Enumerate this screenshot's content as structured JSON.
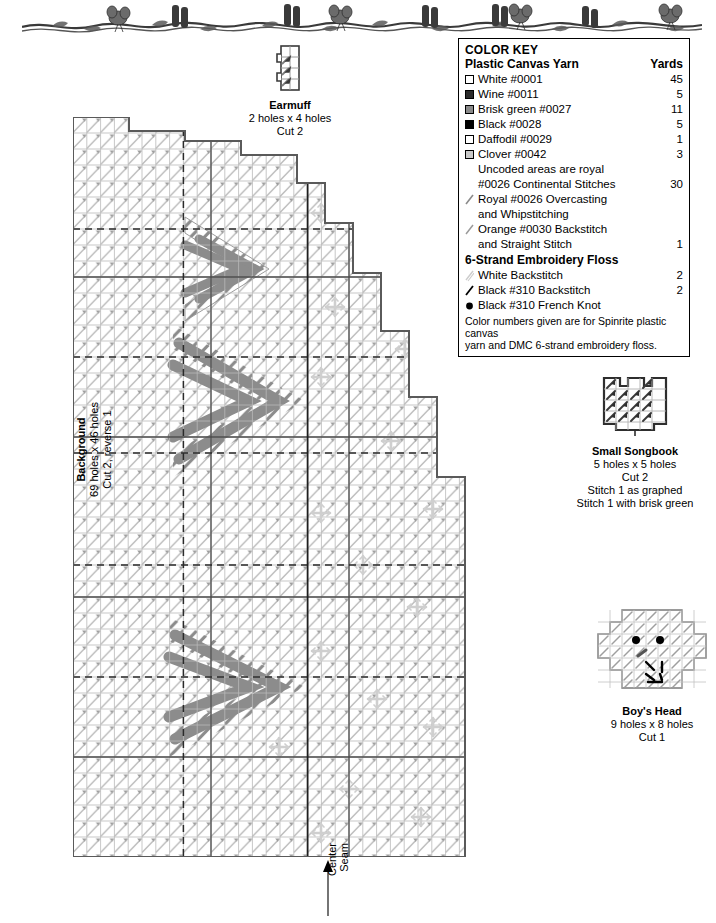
{
  "banner": {
    "icon": "vine-floral-border"
  },
  "color_key": {
    "title": "COLOR KEY",
    "section1_label": "Plastic Canvas Yarn",
    "yards_header": "Yards",
    "yarn_rows": [
      {
        "swatch": "white-swatch",
        "color": "#ffffff",
        "label": "White #0001",
        "yards": "45"
      },
      {
        "swatch": "wine-swatch",
        "color": "#2b2b2b",
        "label": "Wine #0011",
        "yards": "5"
      },
      {
        "swatch": "brisk-green-swatch",
        "color": "#8a8a8a",
        "label": "Brisk green #0027",
        "yards": "11"
      },
      {
        "swatch": "black-swatch",
        "color": "#000000",
        "label": "Black #0028",
        "yards": "5"
      },
      {
        "swatch": "daffodil-swatch",
        "color": "#ffffff",
        "label": "Daffodil #0029",
        "yards": "1"
      },
      {
        "swatch": "clover-swatch",
        "color": "#c8c8c8",
        "label": "Clover #0042",
        "yards": "3"
      }
    ],
    "uncoded_line1": "Uncoded areas are royal",
    "uncoded_line2": "#0026 Continental Stitches",
    "uncoded_yards": "30",
    "stitch_rows": [
      {
        "icon": "royal-overcasting-stroke-icon",
        "color": "#8a8a8a",
        "line1": "Royal #0026 Overcasting",
        "line2": "and Whipstitching",
        "yards": ""
      },
      {
        "icon": "orange-backstitch-stroke-icon",
        "color": "#9a9a9a",
        "line1": "Orange #0030 Backstitch",
        "line2": "and Straight Stitch",
        "yards": "1"
      }
    ],
    "section2_label": "6-Strand Embroidery Floss",
    "floss_rows": [
      {
        "icon": "white-backstitch-stroke-icon",
        "label": "White Backstitch",
        "yards": "2"
      },
      {
        "icon": "black-backstitch-stroke-icon",
        "label": "Black #310 Backstitch",
        "yards": "2"
      },
      {
        "icon": "black-french-knot-icon",
        "label": "Black #310 French Knot",
        "yards": ""
      }
    ],
    "note_line1": "Color numbers given are for Spinrite plastic canvas",
    "note_line2": "yarn and DMC 6-strand embroidery floss."
  },
  "pieces": {
    "earmuff": {
      "title": "Earmuff",
      "size": "2 holes x 4 holes",
      "cut": "Cut 2"
    },
    "songbook": {
      "title": "Small Songbook",
      "size": "5 holes x 5 holes",
      "cut": "Cut 2",
      "note1": "Stitch 1 as graphed",
      "note2": "Stitch 1 with brisk green"
    },
    "boys_head": {
      "title": "Boy's Head",
      "size": "9 holes x 8 holes",
      "cut": "Cut 1"
    }
  },
  "background_chart": {
    "title": "Background",
    "size": "69 holes x 46 holes",
    "cut": "Cut 2, reverse 1",
    "center_seam_label": "Center\nSeam",
    "center_seam_line1": "Center",
    "center_seam_line2": "Seam"
  },
  "colors": {
    "grid_line": "#b9b9b9",
    "grid_major": "#4a4a4a",
    "outline": "#555555",
    "stitch_light": "#b5b5b5",
    "stitch_dark": "#8c8c8c",
    "snowflake": "#cfcfcf",
    "dashed_guide": "#2a2a2a"
  }
}
